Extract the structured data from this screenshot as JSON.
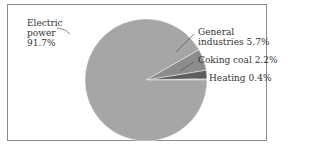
{
  "chart_data": {
    "type": "pie",
    "title": "",
    "categories": [
      "Electric power",
      "General industries",
      "Coking coal",
      "Heating"
    ],
    "values": [
      91.7,
      5.7,
      2.2,
      0.4
    ],
    "unit": "%",
    "colors": [
      "#a6a6a6",
      "#8c8c8c",
      "#5e5e5e",
      "#b8b8b8"
    ],
    "start_angle_deg": 0,
    "direction": "counterclockwise",
    "legend": "none (direct labels with leader lines)",
    "labels": [
      {
        "line1": "Electric",
        "line2": "power",
        "line3": "91.7%"
      },
      {
        "line1": "General",
        "line2": "industries",
        "value": "5.7%"
      },
      {
        "line1": "Coking coal",
        "value": "2.2%"
      },
      {
        "line1": "Heating",
        "value": "0.4%"
      }
    ]
  },
  "labels": {
    "electric": {
      "l1": "Electric",
      "l2": "power",
      "l3": "91.7%"
    },
    "general": {
      "l1": "General",
      "l2": "industries",
      "value": "5.7%"
    },
    "coking": {
      "name": "Coking coal",
      "value": "2.2%"
    },
    "heating": {
      "name": "Heating",
      "value": "0.4%"
    }
  }
}
